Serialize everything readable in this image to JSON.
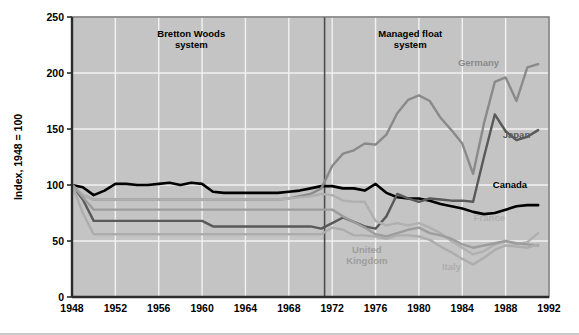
{
  "chart_data": {
    "type": "line",
    "title": "",
    "xlabel": "",
    "ylabel": "Index, 1948 = 100",
    "xlim": [
      1948,
      1992
    ],
    "ylim": [
      0,
      250
    ],
    "grid": true,
    "legend_position": "inline-annotations",
    "plot_background": "#c4c4c4",
    "gridline_color": "#f2f2f2",
    "xticks": [
      1948,
      1952,
      1956,
      1960,
      1964,
      1968,
      1972,
      1976,
      1980,
      1984,
      1988,
      1992
    ],
    "yticks": [
      0,
      50,
      100,
      150,
      200,
      250
    ],
    "annotations": [
      {
        "name": "bretton-woods",
        "text_line1": "Bretton Woods",
        "text_line2": "system",
        "x": 1959.0,
        "y": 232,
        "color": "#000000"
      },
      {
        "name": "managed-float",
        "text_line1": "Managed float",
        "text_line2": "system",
        "x": 1979.2,
        "y": 232,
        "color": "#000000"
      }
    ],
    "divider": {
      "name": "regime-divider",
      "x": 1971.3,
      "color": "#4d4d4d",
      "label": "End of Bretton Woods"
    },
    "series": [
      {
        "name": "Canada",
        "color": "#000000",
        "width": 2.6,
        "label_x": 1988.4,
        "label_y": 97,
        "x": [
          1948,
          1949,
          1950,
          1951,
          1952,
          1953,
          1954,
          1955,
          1956,
          1957,
          1958,
          1959,
          1960,
          1961,
          1962,
          1963,
          1964,
          1965,
          1966,
          1967,
          1968,
          1969,
          1970,
          1971,
          1972,
          1973,
          1974,
          1975,
          1976,
          1977,
          1978,
          1979,
          1980,
          1981,
          1982,
          1983,
          1984,
          1985,
          1986,
          1987,
          1988,
          1989,
          1990,
          1991
        ],
        "values": [
          100,
          98,
          91,
          95,
          101,
          101,
          100,
          100,
          101,
          102,
          100,
          102,
          101,
          94,
          93,
          93,
          93,
          93,
          93,
          93,
          94,
          95,
          97,
          99,
          99,
          97,
          97,
          95,
          101,
          93,
          89,
          88,
          88,
          86,
          83,
          81,
          79,
          76,
          74,
          75,
          78,
          81,
          82,
          82
        ]
      },
      {
        "name": "Japan",
        "color": "#595959",
        "width": 2.4,
        "label_x": 1989.0,
        "label_y": 142,
        "x": [
          1948,
          1949,
          1950,
          1951,
          1952,
          1953,
          1954,
          1955,
          1956,
          1957,
          1958,
          1959,
          1960,
          1961,
          1962,
          1963,
          1964,
          1965,
          1966,
          1967,
          1968,
          1969,
          1970,
          1971,
          1972,
          1973,
          1974,
          1975,
          1976,
          1977,
          1978,
          1979,
          1980,
          1981,
          1982,
          1983,
          1984,
          1985,
          1986,
          1987,
          1988,
          1989,
          1990,
          1991
        ],
        "values": [
          100,
          87,
          68,
          68,
          68,
          68,
          68,
          68,
          68,
          68,
          68,
          68,
          68,
          63,
          63,
          63,
          63,
          63,
          63,
          63,
          63,
          63,
          63,
          61,
          66,
          71,
          67,
          63,
          61,
          72,
          92,
          88,
          85,
          88,
          87,
          86,
          86,
          85,
          125,
          163,
          148,
          140,
          143,
          149
        ]
      },
      {
        "name": "Germany",
        "color": "#8a8a8a",
        "width": 2.4,
        "label_x": 1985.5,
        "label_y": 206,
        "x": [
          1948,
          1949,
          1950,
          1951,
          1952,
          1953,
          1954,
          1955,
          1956,
          1957,
          1958,
          1959,
          1960,
          1961,
          1962,
          1963,
          1964,
          1965,
          1966,
          1967,
          1968,
          1969,
          1970,
          1971,
          1972,
          1973,
          1974,
          1975,
          1976,
          1977,
          1978,
          1979,
          1980,
          1981,
          1982,
          1983,
          1984,
          1985,
          1986,
          1987,
          1988,
          1989,
          1990,
          1991
        ],
        "values": [
          100,
          91,
          87,
          87,
          87,
          87,
          87,
          87,
          87,
          87,
          87,
          87,
          87,
          87,
          87,
          87,
          87,
          87,
          87,
          87,
          88,
          90,
          92,
          97,
          117,
          128,
          131,
          137,
          136,
          145,
          164,
          176,
          180,
          175,
          160,
          149,
          137,
          110,
          155,
          192,
          196,
          175,
          205,
          208
        ]
      },
      {
        "name": "France",
        "color": "#b0b0b0",
        "width": 2.4,
        "label_x": 1986.5,
        "label_y": 68,
        "x": [
          1948,
          1949,
          1950,
          1951,
          1952,
          1953,
          1954,
          1955,
          1956,
          1957,
          1958,
          1959,
          1960,
          1961,
          1962,
          1963,
          1964,
          1965,
          1966,
          1967,
          1968,
          1969,
          1970,
          1971,
          1972,
          1973,
          1974,
          1975,
          1976,
          1977,
          1978,
          1979,
          1980,
          1981,
          1982,
          1983,
          1984,
          1985,
          1986,
          1987,
          1988,
          1989,
          1990,
          1991
        ],
        "values": [
          100,
          91,
          87,
          87,
          87,
          87,
          87,
          87,
          87,
          87,
          87,
          87,
          87,
          87,
          87,
          87,
          87,
          87,
          87,
          87,
          88,
          89,
          90,
          92,
          91,
          86,
          85,
          85,
          68,
          64,
          66,
          64,
          66,
          62,
          57,
          50,
          44,
          38,
          41,
          47,
          50,
          47,
          49,
          57
        ]
      },
      {
        "name": "United Kingdom",
        "color": "#9d9d9d",
        "width": 2.4,
        "label_x": 1975.2,
        "label_y": 39,
        "x": [
          1948,
          1949,
          1950,
          1951,
          1952,
          1953,
          1954,
          1955,
          1956,
          1957,
          1958,
          1959,
          1960,
          1961,
          1962,
          1963,
          1964,
          1965,
          1966,
          1967,
          1968,
          1969,
          1970,
          1971,
          1972,
          1973,
          1974,
          1975,
          1976,
          1977,
          1978,
          1979,
          1980,
          1981,
          1982,
          1983,
          1984,
          1985,
          1986,
          1987,
          1988,
          1989,
          1990,
          1991
        ],
        "values": [
          100,
          89,
          78,
          78,
          78,
          78,
          78,
          78,
          78,
          78,
          78,
          78,
          78,
          78,
          78,
          78,
          78,
          78,
          78,
          78,
          78,
          78,
          78,
          78,
          78,
          72,
          67,
          62,
          56,
          54,
          57,
          60,
          62,
          57,
          55,
          52,
          47,
          44,
          46,
          48,
          50,
          48,
          47,
          46
        ]
      },
      {
        "name": "Italy",
        "color": "#adadad",
        "width": 2.4,
        "label_x": 1983.0,
        "label_y": 24,
        "x": [
          1948,
          1949,
          1950,
          1951,
          1952,
          1953,
          1954,
          1955,
          1956,
          1957,
          1958,
          1959,
          1960,
          1961,
          1962,
          1963,
          1964,
          1965,
          1966,
          1967,
          1968,
          1969,
          1970,
          1971,
          1972,
          1973,
          1974,
          1975,
          1976,
          1977,
          1978,
          1979,
          1980,
          1981,
          1982,
          1983,
          1984,
          1985,
          1986,
          1987,
          1988,
          1989,
          1990,
          1991
        ],
        "values": [
          100,
          75,
          56,
          56,
          56,
          56,
          56,
          56,
          56,
          56,
          56,
          56,
          56,
          56,
          56,
          56,
          56,
          56,
          56,
          56,
          56,
          56,
          56,
          56,
          62,
          60,
          55,
          55,
          54,
          52,
          55,
          55,
          54,
          51,
          45,
          40,
          34,
          29,
          35,
          42,
          46,
          45,
          44,
          47
        ]
      }
    ]
  }
}
